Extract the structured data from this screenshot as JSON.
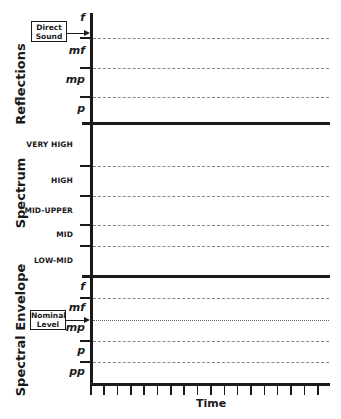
{
  "sections": {
    "reflections": {
      "label": "Reflections",
      "levels": [
        "f",
        "mf",
        "mp",
        "p"
      ],
      "annotation": {
        "line1": "Direct",
        "line2": "Sound"
      }
    },
    "spectrum": {
      "label": "Spectrum",
      "bands": [
        "VERY HIGH",
        "HIGH",
        "MID-UPPER",
        "MID",
        "LOW-MID"
      ]
    },
    "envelope": {
      "label": "Spectral Envelope",
      "levels": [
        "f",
        "mf",
        "mp",
        "p",
        "pp"
      ],
      "annotation": {
        "line1": "Nominal",
        "line2": "Level"
      }
    }
  },
  "x_axis": {
    "label": "Time",
    "tick_count": 18
  },
  "colors": {
    "ink": "#1a1a1a",
    "dashed": "#888888",
    "background": "#ffffff"
  }
}
